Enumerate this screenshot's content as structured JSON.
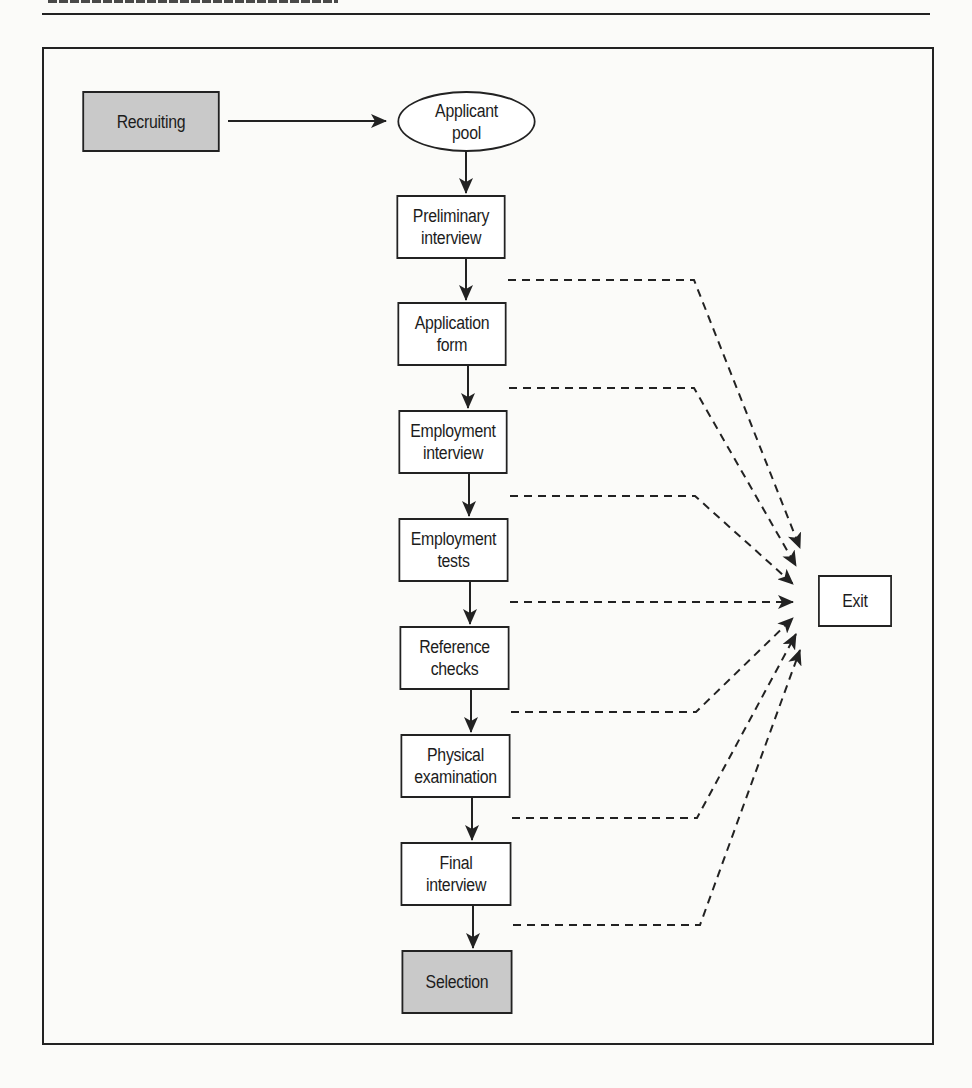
{
  "page": {
    "header_rule": true
  },
  "diagram": {
    "start": {
      "label": "Recruiting",
      "fill": "#c9c9c9"
    },
    "pool": {
      "label": "Applicant\npool"
    },
    "steps": [
      {
        "label": "Preliminary\ninterview"
      },
      {
        "label": "Application\nform"
      },
      {
        "label": "Employment\ninterview"
      },
      {
        "label": "Employment\ntests"
      },
      {
        "label": "Reference\nchecks"
      },
      {
        "label": "Physical\nexamination"
      },
      {
        "label": "Final\ninterview"
      }
    ],
    "end": {
      "label": "Selection",
      "fill": "#c9c9c9"
    },
    "exit": {
      "label": "Exit"
    },
    "colors": {
      "line": "#222222",
      "shaded": "#c9c9c9",
      "box": "#ffffff"
    }
  }
}
